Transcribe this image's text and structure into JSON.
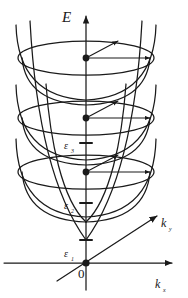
{
  "figure": {
    "name": "subband-dispersion-paraboloids",
    "background": "#ffffff",
    "stroke": "#1a1a1a",
    "width": 188,
    "height": 298
  },
  "axes": {
    "energy": {
      "label": "E",
      "name": "energy-axis",
      "x": 86,
      "y_top": 14,
      "y_bottom": 290
    },
    "kx": {
      "label": "k",
      "subscript": "x",
      "name": "kx-axis",
      "y": 263,
      "x_left": 4,
      "x_right": 176
    },
    "ky": {
      "label": "k",
      "subscript": "y",
      "name": "ky-axis",
      "x1": 57,
      "y1": 281,
      "x2": 160,
      "y2": 214
    }
  },
  "origin": {
    "label": "0",
    "x": 86,
    "y": 263
  },
  "levels": [
    {
      "id": "level-3",
      "label": "ε",
      "subscript": "3",
      "label_x": 70,
      "label_y": 146,
      "rim_cy": 58,
      "rim_rx": 68,
      "rim_ry": 17,
      "bowl_bottom": 0,
      "dot_x": 86,
      "dot_y": 58
    },
    {
      "id": "level-2",
      "label": "ε",
      "subscript": "2",
      "label_x": 70,
      "label_y": 206,
      "rim_cy": 118,
      "rim_rx": 68,
      "rim_ry": 17,
      "bowl_bottom": 143,
      "dot_x": 86,
      "dot_y": 118
    },
    {
      "id": "level-1",
      "label": "ε",
      "subscript": "1",
      "label_x": 70,
      "label_y": 256,
      "rim_cy": 172,
      "rim_rx": 68,
      "rim_ry": 17,
      "bowl_bottom": 203,
      "dot_x": 86,
      "dot_y": 172
    }
  ],
  "tick_marks": [
    {
      "name": "tick-epsilon-3",
      "y": 143
    },
    {
      "name": "tick-epsilon-2",
      "y": 203
    },
    {
      "name": "tick-epsilon-1",
      "y": 240
    }
  ],
  "vectors": [
    {
      "name": "k-vector-horizontal-band-3",
      "x1": 86,
      "y1": 58,
      "x2": 152,
      "y2": 58
    },
    {
      "name": "k-vector-diagonal-band-3",
      "x1": 86,
      "y1": 58,
      "x2": 119,
      "y2": 40
    },
    {
      "name": "k-vector-horizontal-band-2",
      "x1": 86,
      "y1": 118,
      "x2": 152,
      "y2": 118
    },
    {
      "name": "k-vector-diagonal-band-2",
      "x1": 86,
      "y1": 118,
      "x2": 119,
      "y2": 100
    },
    {
      "name": "k-vector-horizontal-band-1",
      "x1": 86,
      "y1": 172,
      "x2": 152,
      "y2": 172
    },
    {
      "name": "k-vector-diagonal-band-1",
      "x1": 86,
      "y1": 172,
      "x2": 119,
      "y2": 154
    }
  ]
}
